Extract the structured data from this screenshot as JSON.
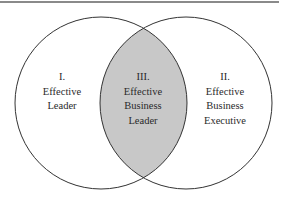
{
  "diagram": {
    "type": "venn",
    "regions": [
      {
        "numeral": "I.",
        "line1": "Effective",
        "line2": "Leader",
        "line3": ""
      },
      {
        "numeral": "II.",
        "line1": "Effective",
        "line2": "Business",
        "line3": "Executive"
      },
      {
        "numeral": "III.",
        "line1": "Effective",
        "line2": "Business",
        "line3": "Leader"
      }
    ],
    "colors": {
      "intersection_fill": "#c8c8c8",
      "stroke": "#333333"
    }
  }
}
